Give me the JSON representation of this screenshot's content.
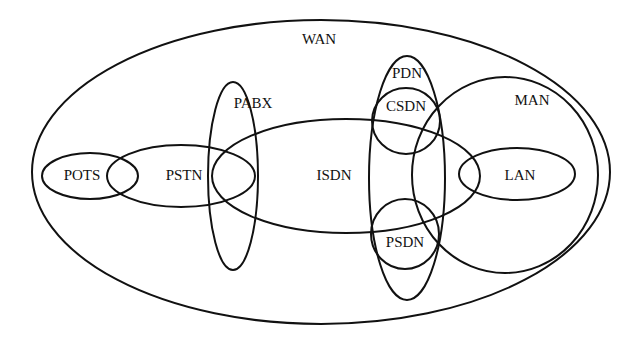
{
  "diagram": {
    "type": "venn-network-taxonomy",
    "background": "#ffffff",
    "stroke_color": "#111111",
    "networks": [
      {
        "id": "wan",
        "label": "WAN",
        "shape": {
          "cx": 321,
          "cy": 172,
          "rx": 289,
          "ry": 152
        },
        "label_pos": {
          "x": 319,
          "y": 41
        }
      },
      {
        "id": "pots",
        "label": "POTS",
        "shape": {
          "cx": 90,
          "cy": 176,
          "rx": 48,
          "ry": 23
        },
        "label_pos": {
          "x": 82,
          "y": 177
        }
      },
      {
        "id": "pstn",
        "label": "PSTN",
        "shape": {
          "cx": 181,
          "cy": 176,
          "rx": 74,
          "ry": 31
        },
        "label_pos": {
          "x": 184,
          "y": 177
        }
      },
      {
        "id": "pabx",
        "label": "PABX",
        "shape": {
          "cx": 233,
          "cy": 176,
          "rx": 25,
          "ry": 94
        },
        "label_pos": {
          "x": 253,
          "y": 105
        }
      },
      {
        "id": "isdn",
        "label": "ISDN",
        "shape": {
          "cx": 346,
          "cy": 176,
          "rx": 134,
          "ry": 57
        },
        "label_pos": {
          "x": 334,
          "y": 177
        }
      },
      {
        "id": "pdn",
        "label": "PDN",
        "shape": {
          "cx": 407,
          "cy": 178,
          "rx": 38,
          "ry": 122
        },
        "label_pos": {
          "x": 407,
          "y": 75
        }
      },
      {
        "id": "csdn",
        "label": "CSDN",
        "shape": {
          "cx": 406,
          "cy": 121,
          "rx": 34,
          "ry": 33
        },
        "label_pos": {
          "x": 406,
          "y": 108
        }
      },
      {
        "id": "psdn",
        "label": "PSDN",
        "shape": {
          "cx": 405,
          "cy": 234,
          "rx": 34,
          "ry": 35
        },
        "label_pos": {
          "x": 405,
          "y": 244
        }
      },
      {
        "id": "man",
        "label": "MAN",
        "shape": {
          "cx": 505,
          "cy": 175,
          "rx": 93,
          "ry": 98
        },
        "label_pos": {
          "x": 532,
          "y": 102
        }
      },
      {
        "id": "lan",
        "label": "LAN",
        "shape": {
          "cx": 517,
          "cy": 174,
          "rx": 58,
          "ry": 26
        },
        "label_pos": {
          "x": 520,
          "y": 177
        }
      }
    ]
  }
}
